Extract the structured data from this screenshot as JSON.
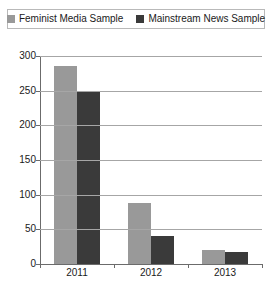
{
  "chart_data": {
    "type": "bar",
    "title": "",
    "xlabel": "",
    "ylabel": "",
    "categories": [
      "2011",
      "2012",
      "2013"
    ],
    "series": [
      {
        "name": "Feminist Media Sample",
        "color": "#999999",
        "values": [
          285,
          88,
          20
        ]
      },
      {
        "name": "Mainstream News Sample",
        "color": "#3a3a3a",
        "values": [
          250,
          40,
          18
        ]
      }
    ],
    "ylim": [
      0,
      300
    ],
    "y_ticks": [
      0,
      50,
      100,
      150,
      200,
      250,
      300
    ],
    "y_tick_labels": [
      "0",
      "50",
      "100",
      "150",
      "200",
      "250",
      "300"
    ],
    "grid": true,
    "legend_position": "top"
  },
  "legend": {
    "entries": [
      {
        "label": "Feminist Media Sample",
        "swatch": "legend-swatch-feminist"
      },
      {
        "label": "Mainstream News Sample",
        "swatch": "legend-swatch-mainstream"
      }
    ]
  },
  "colors": {
    "series_light": "#999999",
    "series_dark": "#3a3a3a",
    "gridline": "#a6a6a6",
    "axis": "#6b6b6b",
    "legend_border": "#b9b9b9",
    "text": "#1a1a1a",
    "background": "#ffffff"
  }
}
